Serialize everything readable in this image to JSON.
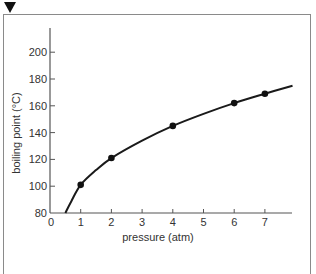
{
  "chart_data": {
    "type": "line",
    "title": "",
    "xlabel": "pressure (atm)",
    "ylabel": "boiling point (°C)",
    "xlim": [
      0,
      8
    ],
    "ylim": [
      80,
      210
    ],
    "x_ticks": [
      0,
      1,
      2,
      3,
      4,
      5,
      6,
      7
    ],
    "y_ticks": [
      80,
      100,
      120,
      140,
      160,
      180,
      200
    ],
    "grid": false,
    "legend": null,
    "series": [
      {
        "name": "boiling point of water",
        "markers": true,
        "points": [
          {
            "x": 1,
            "y": 101
          },
          {
            "x": 2,
            "y": 121
          },
          {
            "x": 4,
            "y": 145
          },
          {
            "x": 6,
            "y": 162
          },
          {
            "x": 7,
            "y": 169
          }
        ],
        "curve": [
          {
            "x": 0.5,
            "y": 80
          },
          {
            "x": 0.7,
            "y": 89
          },
          {
            "x": 1,
            "y": 101
          },
          {
            "x": 1.5,
            "y": 112
          },
          {
            "x": 2,
            "y": 121
          },
          {
            "x": 3,
            "y": 134
          },
          {
            "x": 4,
            "y": 145
          },
          {
            "x": 5,
            "y": 154
          },
          {
            "x": 6,
            "y": 162
          },
          {
            "x": 7,
            "y": 169
          },
          {
            "x": 7.9,
            "y": 175
          }
        ]
      }
    ]
  },
  "colors": {
    "line": "#1a1a1a",
    "axis": "#555555",
    "frame": "#8a8a8a",
    "marker": "#111111"
  }
}
